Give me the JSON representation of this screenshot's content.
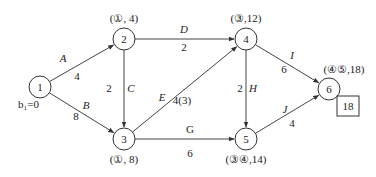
{
  "nodes": [
    {
      "id": "1",
      "label": "1",
      "x": 40,
      "y": 87,
      "annotation": "b₁=0",
      "ann_x": 18,
      "ann_y": 108
    },
    {
      "id": "2",
      "label": "2",
      "x": 124,
      "y": 39,
      "annotation": "(①, 4)",
      "ann_x": 124,
      "ann_y": 22
    },
    {
      "id": "3",
      "label": "3",
      "x": 124,
      "y": 139,
      "annotation": "(①, 8)",
      "ann_x": 124,
      "ann_y": 163
    },
    {
      "id": "4",
      "label": "4",
      "x": 246,
      "y": 39,
      "annotation": "(③,12)",
      "ann_x": 246,
      "ann_y": 22
    },
    {
      "id": "5",
      "label": "5",
      "x": 246,
      "y": 139,
      "annotation": "(③④,14)",
      "ann_x": 246,
      "ann_y": 163
    },
    {
      "id": "6",
      "label": "6",
      "x": 329,
      "y": 89,
      "annotation": "(④⑤,18)",
      "ann_x": 344,
      "ann_y": 73
    }
  ],
  "edges": [
    {
      "from": "1",
      "to": "2",
      "name": "A",
      "weight": "4",
      "name_x": 63,
      "name_y": 62,
      "w_x": 77,
      "w_y": 80
    },
    {
      "from": "1",
      "to": "3",
      "name": "B",
      "weight": "8",
      "name_x": 86,
      "name_y": 109,
      "w_x": 76,
      "w_y": 120
    },
    {
      "from": "2",
      "to": "3",
      "name": "C",
      "weight": "2",
      "name_x": 131,
      "name_y": 92,
      "w_x": 109,
      "w_y": 92
    },
    {
      "from": "2",
      "to": "4",
      "name": "D",
      "weight": "2",
      "name_x": 184,
      "name_y": 33,
      "w_x": 184,
      "w_y": 51
    },
    {
      "from": "3",
      "to": "4",
      "name": "E",
      "weight": "4(3)",
      "name_x": 162,
      "name_y": 101,
      "w_x": 182,
      "w_y": 104
    },
    {
      "from": "3",
      "to": "5",
      "name": "G",
      "weight": "6",
      "name_x": 190,
      "name_y": 133,
      "w_x": 190,
      "w_y": 157
    },
    {
      "from": "4",
      "to": "5",
      "name": "H",
      "weight": "2",
      "name_x": 253,
      "name_y": 92,
      "w_x": 240,
      "w_y": 92
    },
    {
      "from": "4",
      "to": "6",
      "name": "I",
      "weight": "6",
      "name_x": 292,
      "name_y": 59,
      "w_x": 284,
      "w_y": 73
    },
    {
      "from": "5",
      "to": "6",
      "name": "J",
      "weight": "4",
      "name_x": 285,
      "name_y": 113,
      "w_x": 292,
      "w_y": 127
    }
  ],
  "result_box": {
    "value": "18",
    "x": 337,
    "y": 96,
    "w": 22,
    "h": 20
  }
}
